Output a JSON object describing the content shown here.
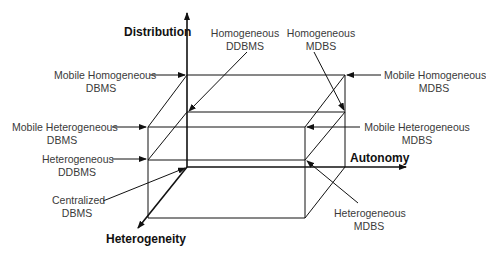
{
  "diagram": {
    "axes": {
      "distribution": "Distribution",
      "autonomy": "Autonomy",
      "heterogeneity": "Heterogeneity"
    },
    "labels": {
      "mobile_homogeneous_dbms": [
        "Mobile Homogeneous",
        "DBMS"
      ],
      "mobile_heterogeneous_dbms": [
        "Mobile Heterogeneous",
        "DBMS"
      ],
      "heterogeneous_ddbms": [
        "Heterogeneous",
        "DDBMS"
      ],
      "centralized_dbms": [
        "Centralized",
        "DBMS"
      ],
      "homogeneous_ddbms": [
        "Homogeneous",
        "DDBMS"
      ],
      "homogeneous_mdbs": [
        "Homogeneous",
        "MDBS"
      ],
      "mobile_homogeneous_mdbs": [
        "Mobile Homogeneous",
        "MDBS"
      ],
      "mobile_heterogeneous_mdbs": [
        "Mobile Heterogeneous",
        "MDBS"
      ],
      "heterogeneous_mdbs": [
        "Heterogeneous",
        "MDBS"
      ]
    },
    "colors": {
      "line": "#111111",
      "text": "#3a3a3a"
    }
  }
}
